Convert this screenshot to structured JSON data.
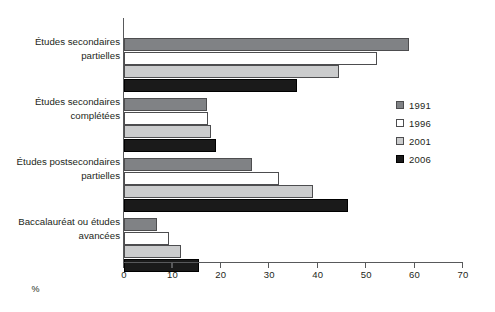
{
  "chart_data": {
    "type": "bar",
    "orientation": "horizontal",
    "title": "",
    "subtitle": "",
    "xlabel": "%",
    "ylabel": "",
    "xlim": [
      0,
      70
    ],
    "xticks": [
      0,
      10,
      20,
      30,
      40,
      50,
      60,
      70
    ],
    "xticklabels": [
      "0",
      "10",
      "20",
      "30",
      "40",
      "50",
      "60",
      "70"
    ],
    "grid": false,
    "legend_position": "right",
    "categories": [
      "Études secondaires partielles",
      "Études secondaires complétées",
      "Études postsecondaires partielles",
      "Baccalauréat ou études avancées"
    ],
    "category_lines": [
      [
        "Études secondaires",
        "partielles"
      ],
      [
        "Études secondaires",
        "complétées"
      ],
      [
        "Études postsecondaires",
        "partielles"
      ],
      [
        "Baccalauréat ou études",
        "avancées"
      ]
    ],
    "series": [
      {
        "name": "1991",
        "color": "#808285",
        "values": [
          58.9,
          17.1,
          26.4,
          6.8
        ]
      },
      {
        "name": "1996",
        "color": "#ffffff",
        "values": [
          52.3,
          17.4,
          32.0,
          9.3
        ]
      },
      {
        "name": "2001",
        "color": "#cbcccd",
        "values": [
          44.4,
          18.0,
          39.0,
          11.8
        ]
      },
      {
        "name": "2006",
        "color": "#1a1a1a",
        "values": [
          35.7,
          19.0,
          46.3,
          15.5
        ]
      }
    ]
  },
  "legend": {
    "entries": [
      {
        "label": "1991",
        "color": "#808285"
      },
      {
        "label": "1996",
        "color": "#ffffff"
      },
      {
        "label": "2001",
        "color": "#cbcccd"
      },
      {
        "label": "2006",
        "color": "#1a1a1a"
      }
    ]
  },
  "axis": {
    "x_title": "%"
  }
}
